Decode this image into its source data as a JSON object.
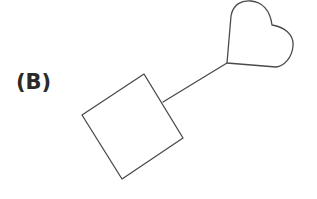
{
  "figure": {
    "label": "(B)",
    "shapes": [
      {
        "kind": "square",
        "description": "rotated square"
      },
      {
        "kind": "line",
        "description": "connector from square to heart"
      },
      {
        "kind": "heart",
        "description": "heart outline"
      }
    ],
    "stroke_color": "#4a4a4a",
    "background": "#ffffff"
  }
}
